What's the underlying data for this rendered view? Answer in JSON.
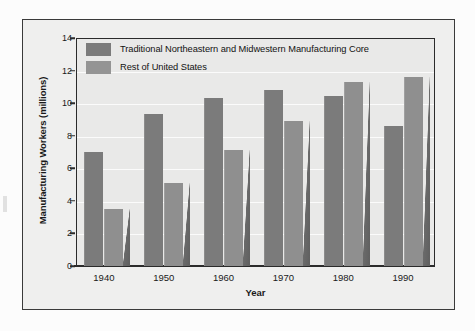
{
  "chart_data": {
    "type": "bar",
    "title": "",
    "xlabel": "Year",
    "ylabel": "Manufacturing Workers (millions)",
    "categories": [
      "1940",
      "1950",
      "1960",
      "1970",
      "1980",
      "1990"
    ],
    "series": [
      {
        "name": "Traditional Northeastern and Midwestern Manufacturing Core",
        "color": "#7b7b7b",
        "values": [
          7.0,
          9.35,
          10.3,
          10.8,
          10.45,
          8.6
        ]
      },
      {
        "name": "Rest of United States",
        "color": "#949494",
        "values": [
          3.5,
          5.1,
          7.1,
          8.9,
          11.3,
          11.6
        ]
      }
    ],
    "ylim": [
      0,
      14
    ],
    "ytick_values": [
      0,
      2,
      4,
      6,
      8,
      10,
      12,
      14
    ],
    "ytick_labels": [
      "0",
      "2",
      "4",
      "6",
      "8",
      "10",
      "12",
      "14"
    ],
    "grid": true,
    "legend_position": "top-left"
  },
  "legend": {
    "entries": [
      {
        "label": "Traditional Northeastern and Midwestern Manufacturing Core"
      },
      {
        "label": "Rest of United States"
      }
    ]
  }
}
